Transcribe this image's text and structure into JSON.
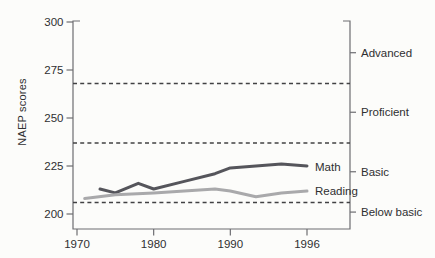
{
  "chart_data": {
    "type": "line",
    "title": "",
    "xlabel": "",
    "ylabel": "NAEP scores",
    "x_ticks": [
      1970,
      1980,
      1990,
      1996
    ],
    "y_ticks": [
      200,
      225,
      250,
      275,
      300
    ],
    "ylim": [
      195,
      300
    ],
    "grid": false,
    "legend_position": "inline-right-of-lines",
    "axis_note": "x ticks evenly spaced; 1990-1996 interval drawn same width as decades",
    "series": [
      {
        "name": "Math",
        "label": "Math",
        "color": "#55555b",
        "stroke_width": 3,
        "points": [
          [
            1973,
            213
          ],
          [
            1975,
            211
          ],
          [
            1978,
            216
          ],
          [
            1980,
            213
          ],
          [
            1984,
            217
          ],
          [
            1988,
            221
          ],
          [
            1990,
            224
          ],
          [
            1992,
            225
          ],
          [
            1994,
            226
          ],
          [
            1996,
            225
          ]
        ]
      },
      {
        "name": "Reading",
        "label": "Reading",
        "color": "#a9a9ab",
        "stroke_width": 3,
        "points": [
          [
            1971,
            208
          ],
          [
            1975,
            210
          ],
          [
            1980,
            211
          ],
          [
            1984,
            212
          ],
          [
            1988,
            213
          ],
          [
            1990,
            212
          ],
          [
            1992,
            209
          ],
          [
            1994,
            211
          ],
          [
            1996,
            212
          ]
        ]
      }
    ],
    "reference_lines": [
      {
        "value": 268,
        "style": "dashed"
      },
      {
        "value": 237,
        "style": "dashed"
      },
      {
        "value": 206,
        "style": "dashed"
      }
    ],
    "right_axis_labels": [
      {
        "label": "Advanced",
        "value": 284
      },
      {
        "label": "Proficient",
        "value": 253
      },
      {
        "label": "Basic",
        "value": 222
      },
      {
        "label": "Below basic",
        "value": 201
      }
    ]
  },
  "colors": {
    "math_line": "#55555b",
    "reading_line": "#a9a9ab",
    "dashed_line": "#414143",
    "axis": "#6d6d71",
    "text": "#2f2f31",
    "background": "#fcfcfa"
  }
}
